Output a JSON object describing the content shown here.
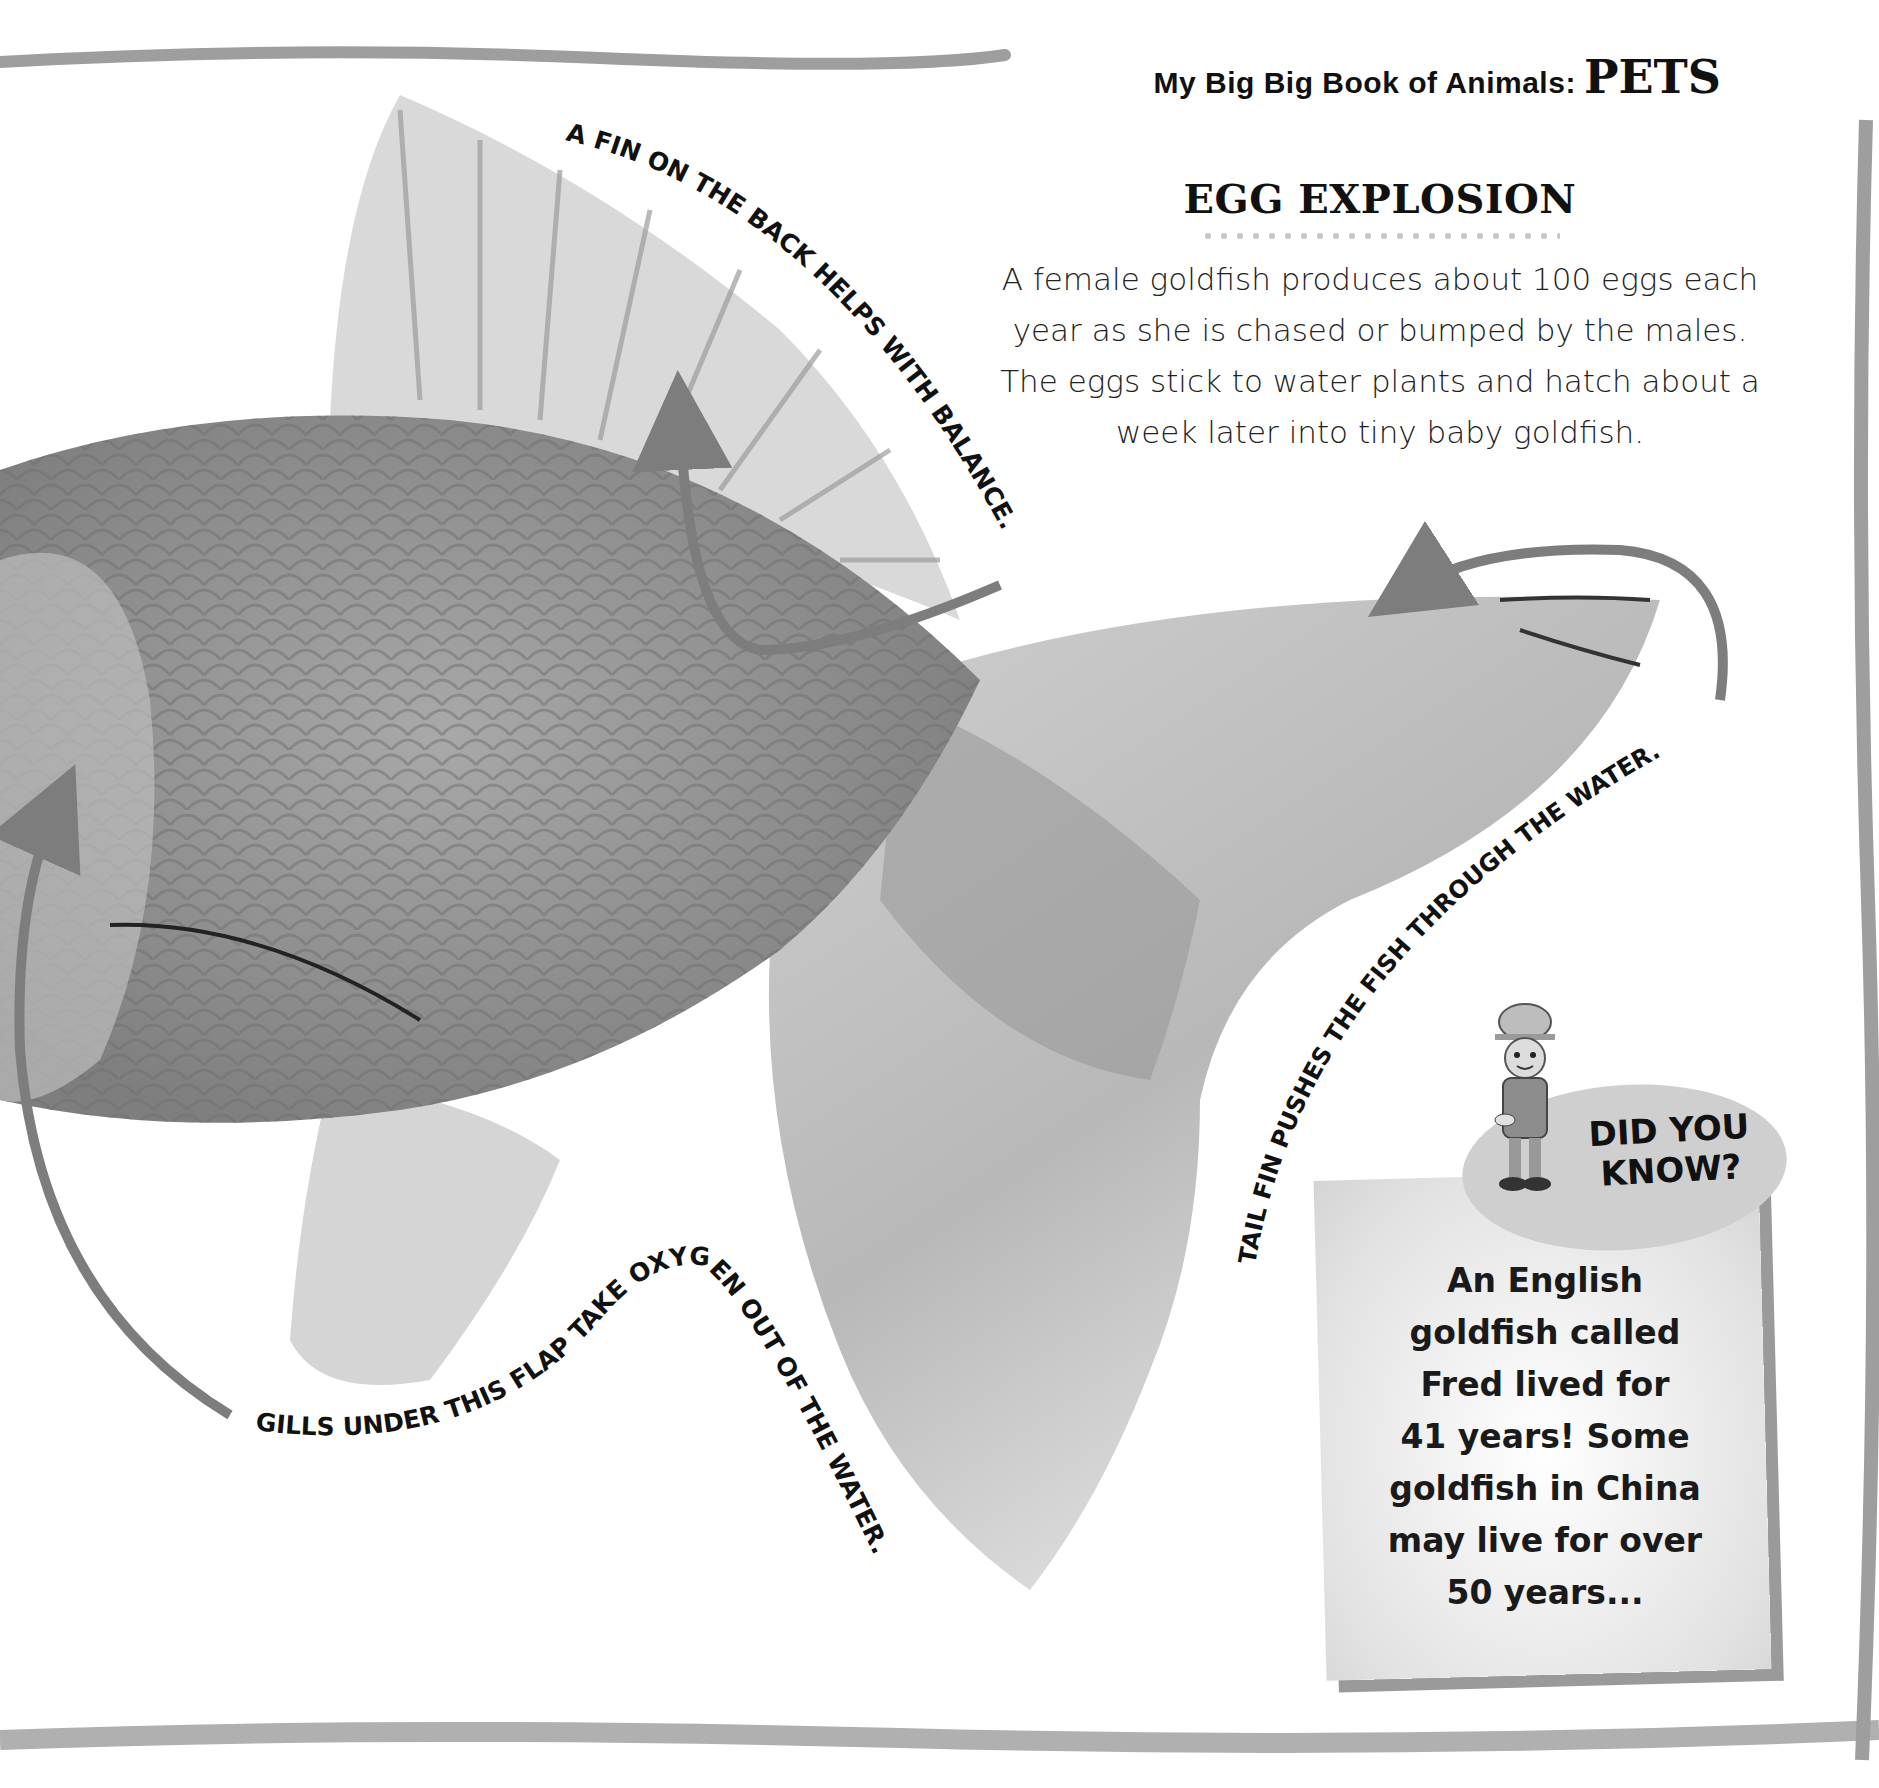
{
  "header": {
    "series_title": "My Big Big Book of Animals:",
    "subject": "PETS"
  },
  "egg_explosion": {
    "heading": "EGG EXPLOSION",
    "body_lines": [
      "A female goldfish produces about 100 eggs each",
      "year as she is chased or bumped by the males.",
      "The eggs stick to water plants and hatch about a",
      "week later into tiny baby goldfish."
    ]
  },
  "labels": {
    "dorsal_fin": "A FIN ON THE BACK HELPS WITH BALANCE.",
    "tail_fin": "TAIL FIN PUSHES THE FISH THROUGH THE WATER.",
    "gills": "GILLS UNDER THIS FLAP TAKE OXYGEN OUT OF THE WATER."
  },
  "did_you_know": {
    "title_lines": [
      "DID YOU",
      "KNOW?"
    ],
    "body_lines": [
      "An English",
      "goldfish called",
      "Fred lived for",
      "41 years! Some",
      "goldfish in China",
      "may live for over",
      "50 years..."
    ]
  },
  "colors": {
    "border": "#9e9e9e",
    "arrow": "#7d7d7d",
    "fish_body": "#8f8f8f",
    "fin_light": "#d6d6d6",
    "text": "#111111"
  }
}
